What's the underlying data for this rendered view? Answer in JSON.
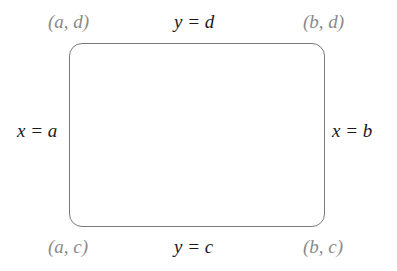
{
  "diagram": {
    "shape": "rounded-rectangle",
    "corners": {
      "top_left": "(a, d)",
      "top_right": "(b, d)",
      "bottom_left": "(a, c)",
      "bottom_right": "(b, c)"
    },
    "edges": {
      "top": "y = d",
      "bottom": "y = c",
      "left": "x = a",
      "right": "x = b"
    },
    "colors": {
      "border": "#7a7a7a",
      "corner_label": "#8a8a8a",
      "edge_label": "#1a1a1a"
    }
  }
}
